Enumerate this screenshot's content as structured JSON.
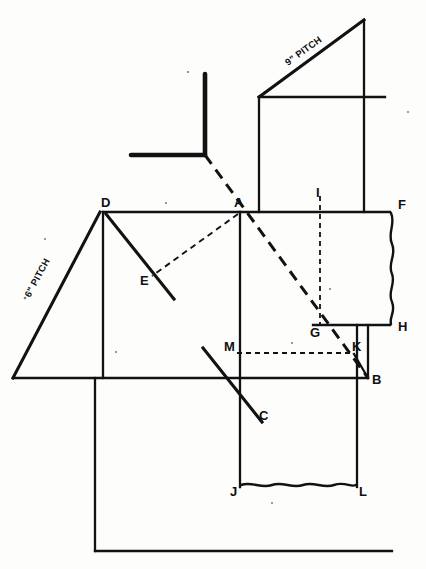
{
  "drawing": {
    "title": "Roof Framing Layout Diagram",
    "ink_color": "#121212",
    "background_color": "#fdfdfc"
  },
  "annotations": {
    "pitch_upper_right": "9\" PITCH",
    "pitch_lower_left": "6\" PITCH"
  },
  "points": {
    "A": "A",
    "B": "B",
    "C": "C",
    "D": "D",
    "E": "E",
    "F": "F",
    "G": "G",
    "H": "H",
    "I": "I",
    "J": "J",
    "K": "K",
    "L": "L",
    "M": "M"
  },
  "geometry": {
    "point_coords": {
      "A": [
        240,
        212
      ],
      "B": [
        368,
        378
      ],
      "C": [
        252,
        403
      ],
      "D": [
        103,
        211
      ],
      "E": [
        146,
        270
      ],
      "F": [
        390,
        212
      ],
      "G": [
        313,
        325
      ],
      "H": [
        390,
        322
      ],
      "I": [
        320,
        198
      ],
      "J": [
        240,
        487
      ],
      "K": [
        354,
        354
      ],
      "L": [
        357,
        487
      ],
      "M": [
        232,
        354
      ]
    },
    "main_ridge_y": 212,
    "eave_y": 378,
    "break_line_right_x": 393,
    "break_line_bottom_y": 485
  }
}
